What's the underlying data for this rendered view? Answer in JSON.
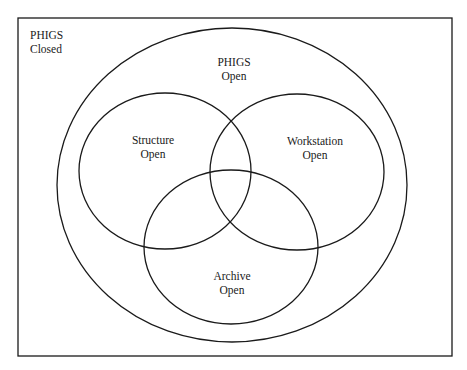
{
  "diagram": {
    "type": "venn",
    "stroke_color": "#1a1a1a",
    "background": "#ffffff",
    "frame": {
      "x": 18,
      "y": 18,
      "width": 434,
      "height": 338
    },
    "regions": [
      {
        "id": "phigs-closed",
        "line1": "PHIGS",
        "line2": "Closed"
      },
      {
        "id": "phigs-open",
        "line1": "PHIGS",
        "line2": "Open",
        "ellipse": {
          "cx": 232,
          "cy": 185,
          "rx": 175,
          "ry": 157
        }
      },
      {
        "id": "structure-open",
        "line1": "Structure",
        "line2": "Open",
        "ellipse": {
          "cx": 165,
          "cy": 171,
          "rx": 86,
          "ry": 78
        }
      },
      {
        "id": "workstation-open",
        "line1": "Workstation",
        "line2": "Open",
        "ellipse": {
          "cx": 297,
          "cy": 172,
          "rx": 87,
          "ry": 78
        }
      },
      {
        "id": "archive-open",
        "line1": "Archive",
        "line2": "Open",
        "ellipse": {
          "cx": 231,
          "cy": 247,
          "rx": 87,
          "ry": 77
        }
      }
    ]
  }
}
